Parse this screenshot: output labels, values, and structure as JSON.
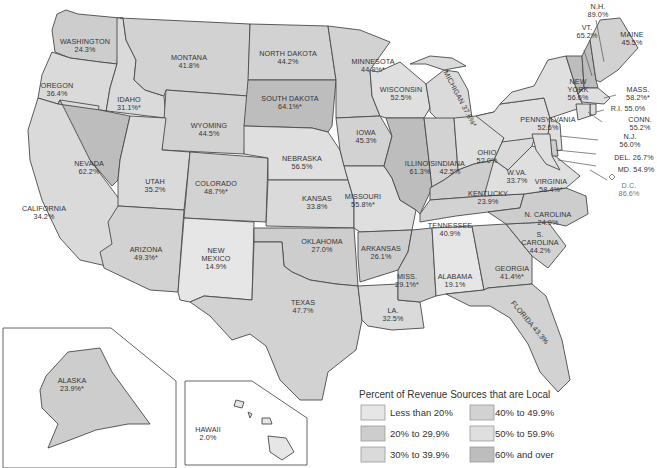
{
  "title": "Percent of Revenue Sources that are Local",
  "legend": {
    "title": "Percent of Revenue Sources that are Local",
    "items": [
      {
        "label": "Less than 20%",
        "color": "#e6e6e6"
      },
      {
        "label": "20% to 29.9%",
        "color": "#cdcdcd"
      },
      {
        "label": "30% to 39.9%",
        "color": "#dadada"
      },
      {
        "label": "40% to 49.9%",
        "color": "#d2d2d2"
      },
      {
        "label": "50% to 59.9%",
        "color": "#dfdfdf"
      },
      {
        "label": "60% and over",
        "color": "#bdbdbd"
      }
    ]
  },
  "states": {
    "WA": {
      "name": "WASHINGTON",
      "value": "24.3%",
      "cat": 1
    },
    "OR": {
      "name": "OREGON",
      "value": "36.4%",
      "cat": 2
    },
    "CA": {
      "name": "CALIFORNIA",
      "value": "34.2%",
      "cat": 2
    },
    "ID": {
      "name": "IDAHO",
      "value": "31.1%*",
      "cat": 2
    },
    "NV": {
      "name": "NEVADA",
      "value": "62.2%",
      "cat": 5
    },
    "MT": {
      "name": "MONTANA",
      "value": "41.8%",
      "cat": 3
    },
    "WY": {
      "name": "WYOMING",
      "value": "44.5%",
      "cat": 3
    },
    "UT": {
      "name": "UTAH",
      "value": "35.2%",
      "cat": 2
    },
    "AZ": {
      "name": "ARIZONA",
      "value": "49.3%*",
      "cat": 3
    },
    "CO": {
      "name": "COLORADO",
      "value": "48.7%*",
      "cat": 3
    },
    "NM": {
      "name_lines": [
        "NEW",
        "MEXICO"
      ],
      "value": "14.9%",
      "cat": 0
    },
    "ND": {
      "name": "NORTH DAKOTA",
      "value": "44.2%",
      "cat": 3
    },
    "SD": {
      "name": "SOUTH DAKOTA",
      "value": "64.1%*",
      "cat": 5
    },
    "NE": {
      "name": "NEBRASKA",
      "value": "56.5%",
      "cat": 4
    },
    "KS": {
      "name": "KANSAS",
      "value": "33.8%",
      "cat": 2
    },
    "OK": {
      "name": "OKLAHOMA",
      "value": "27.0%",
      "cat": 1
    },
    "TX": {
      "name": "TEXAS",
      "value": "47.7%",
      "cat": 3
    },
    "MN": {
      "name": "MINNESOTA",
      "value": "44.9%*",
      "cat": 3
    },
    "IA": {
      "name": "IOWA",
      "value": "45.3%",
      "cat": 3
    },
    "MO": {
      "name": "MISSOURI",
      "value": "55.8%*",
      "cat": 4
    },
    "AR": {
      "name": "ARKANSAS",
      "value": "26.1%",
      "cat": 1
    },
    "LA": {
      "name": "LA.",
      "value": "32.5%",
      "cat": 2
    },
    "WI": {
      "name": "WISCONSIN",
      "value": "52.5%",
      "cat": 4
    },
    "IL": {
      "name": "ILLINOIS",
      "value": "61.3%",
      "cat": 5
    },
    "MI": {
      "name": "MICHIGAN",
      "value": "37.6%*",
      "cat": 2
    },
    "IN": {
      "name": "INDIANA",
      "value": "42.5%",
      "cat": 3
    },
    "OH": {
      "name": "OHIO",
      "value": "52.0%",
      "cat": 4
    },
    "KY": {
      "name": "KENTUCKY",
      "value": "23.9%",
      "cat": 1
    },
    "TN": {
      "name": "TENNESSEE",
      "value": "40.9%",
      "cat": 3
    },
    "MS": {
      "name": "MISS.",
      "value": "29.1%*",
      "cat": 1
    },
    "AL": {
      "name": "ALABAMA",
      "value": "19.1%",
      "cat": 0
    },
    "GA": {
      "name": "GEORGIA",
      "value": "41.4%*",
      "cat": 3
    },
    "FL": {
      "name": "FLORIDA",
      "value": "43.3%",
      "cat": 3
    },
    "SC": {
      "name_lines": [
        "S.",
        "CAROLINA"
      ],
      "value": "44.2%",
      "cat": 3
    },
    "NC": {
      "name": "N. CAROLINA",
      "value": "24.9%",
      "cat": 1
    },
    "VA": {
      "name": "VIRGINIA",
      "value": "58.4%*",
      "cat": 4
    },
    "WV": {
      "name": "W.VA.",
      "value": "33.7%",
      "cat": 2
    },
    "PA": {
      "name": "PENNSYLVANIA",
      "value": "52.6%",
      "cat": 4
    },
    "NY": {
      "name_lines": [
        "NEW",
        "YORK"
      ],
      "value": "56.6%",
      "cat": 4
    },
    "VT": {
      "name": "VT.",
      "value": "65.2%",
      "cat": 5
    },
    "NH": {
      "name": "N.H.",
      "value": "89.0%",
      "cat": 5
    },
    "ME": {
      "name": "MAINE",
      "value": "45.5%",
      "cat": 3
    },
    "MA": {
      "name": "MASS.",
      "value": "58.2%*",
      "cat": 4
    },
    "RI": {
      "name": "R.I.",
      "value": "55.0%",
      "cat": 4
    },
    "CT": {
      "name": "CONN.",
      "value": "55.2%",
      "cat": 4
    },
    "NJ": {
      "name": "N.J.",
      "value": "56.0%",
      "cat": 4
    },
    "DE": {
      "name": "DEL.",
      "value": "26.7%",
      "cat": 1
    },
    "MD": {
      "name": "MD.",
      "value": "54.9%",
      "cat": 4
    },
    "DC": {
      "name": "D.C.",
      "value": "86.6%",
      "cat": 5
    },
    "AK": {
      "name": "ALASKA",
      "value": "23.9%*",
      "cat": 1
    },
    "HI": {
      "name": "HAWAII",
      "value": "2.0%",
      "cat": 0
    }
  }
}
